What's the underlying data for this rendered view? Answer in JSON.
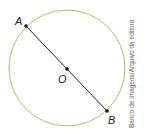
{
  "diagram": {
    "type": "circle-with-diameter",
    "circle": {
      "cx": 67,
      "cy": 68,
      "r": 58,
      "stroke": "#a8c46a"
    },
    "segment": {
      "from": "A",
      "to": "B",
      "stroke": "#222222"
    },
    "points": [
      {
        "id": "A",
        "label": "A",
        "x": 26,
        "y": 26
      },
      {
        "id": "O",
        "label": "O",
        "x": 67,
        "y": 69
      },
      {
        "id": "B",
        "label": "B",
        "x": 107,
        "y": 111
      }
    ]
  },
  "credit": "Banco de imagens/Arquivo da editora"
}
